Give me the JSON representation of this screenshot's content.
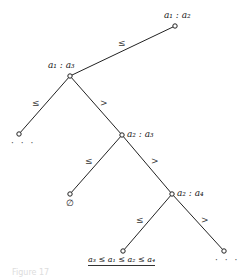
{
  "diagram": {
    "type": "decision-tree",
    "nodes": {
      "root": {
        "label": "a₁ : a₂"
      },
      "n_a1a3": {
        "label": "a₁ : a₃"
      },
      "n_a2a3": {
        "label": "a₂ : a₃"
      },
      "n_a2a4": {
        "label": "a₂ : a₄"
      },
      "leaf_left": {
        "label": "· · ·"
      },
      "leaf_empty": {
        "label": "∅"
      },
      "leaf_result": {
        "label": "a₃ ≤ a₁ ≤ a₂ ≤ a₄"
      },
      "leaf_right": {
        "label": "· · ·"
      }
    },
    "edges": {
      "root_to_a1a3": "≤",
      "a1a3_left": "≤",
      "a1a3_right": ">",
      "a2a3_left": "≤",
      "a2a3_right": ">",
      "a2a4_left": "≤",
      "a2a4_right": ">"
    },
    "caption": "Figure 17"
  }
}
